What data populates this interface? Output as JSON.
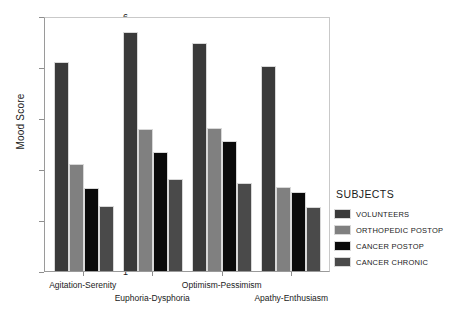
{
  "chart_data": {
    "type": "bar",
    "title": "",
    "xlabel": "",
    "ylabel": "Mood Score",
    "ylim": [
      1,
      6
    ],
    "yticks": [
      1,
      2,
      3,
      4,
      5,
      6
    ],
    "grid": false,
    "legend_position": "right",
    "legend_title": "SUBJECTS",
    "categories": [
      "Agitation-Serenity",
      "Euphoria-Dysphoria",
      "Optimism-Pessimism",
      "Apathy-Enthusiasm"
    ],
    "series": [
      {
        "name": "VOLUNTEERS",
        "color": "#3a3a3a",
        "values": [
          5.1,
          5.68,
          5.48,
          5.02
        ]
      },
      {
        "name": "ORTHOPEDIC POSTOP",
        "color": "#808080",
        "values": [
          3.1,
          3.78,
          3.8,
          2.65
        ]
      },
      {
        "name": "CANCER POSTOP",
        "color": "#0a0a0a",
        "values": [
          2.63,
          3.33,
          3.55,
          2.55
        ]
      },
      {
        "name": "CANCER CHRONIC",
        "color": "#4a4a4a",
        "values": [
          2.28,
          2.8,
          2.72,
          2.25
        ]
      }
    ]
  },
  "axes": {
    "y_title": "Mood Score",
    "y_tick_labels": [
      "1",
      "2",
      "3",
      "4",
      "5",
      "6"
    ],
    "x_tick_labels": [
      "Agitation-Serenity",
      "Euphoria-Dysphoria",
      "Optimism-Pessimism",
      "Apathy-Enthusiasm"
    ]
  },
  "legend": {
    "title": "SUBJECTS",
    "items": [
      {
        "label": "VOLUNTEERS",
        "color": "#3a3a3a"
      },
      {
        "label": "ORTHOPEDIC POSTOP",
        "color": "#808080"
      },
      {
        "label": "CANCER POSTOP",
        "color": "#0a0a0a"
      },
      {
        "label": "CANCER CHRONIC",
        "color": "#4a4a4a"
      }
    ]
  }
}
